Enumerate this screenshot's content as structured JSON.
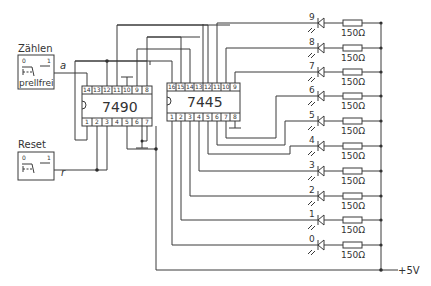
{
  "diagram": {
    "type": "circuit-schematic",
    "switches": [
      {
        "label": "Zählen",
        "signal": "a",
        "state_low": "0",
        "state_high": "1",
        "note": "prellfrei"
      },
      {
        "label": "Reset",
        "signal": "r",
        "state_low": "0",
        "state_high": "1"
      }
    ],
    "ic1": {
      "name": "7490",
      "top_pins": [
        "14",
        "13",
        "12",
        "11",
        "10",
        "9",
        "8"
      ],
      "bottom_pins": [
        "1",
        "2",
        "3",
        "4",
        "5",
        "6",
        "7"
      ]
    },
    "ic2": {
      "name": "7445",
      "top_pins": [
        "16",
        "15",
        "14",
        "13",
        "12",
        "11",
        "10",
        "9"
      ],
      "bottom_pins": [
        "1",
        "2",
        "3",
        "4",
        "5",
        "6",
        "7",
        "8"
      ]
    },
    "leds": [
      {
        "digit": "9",
        "resistor": "150Ω"
      },
      {
        "digit": "8",
        "resistor": "150Ω"
      },
      {
        "digit": "7",
        "resistor": "150Ω"
      },
      {
        "digit": "6",
        "resistor": "150Ω"
      },
      {
        "digit": "5",
        "resistor": "150Ω"
      },
      {
        "digit": "4",
        "resistor": "150Ω"
      },
      {
        "digit": "3",
        "resistor": "150Ω"
      },
      {
        "digit": "2",
        "resistor": "150Ω"
      },
      {
        "digit": "1",
        "resistor": "150Ω"
      },
      {
        "digit": "0",
        "resistor": "150Ω"
      }
    ],
    "supply": "+5V"
  }
}
